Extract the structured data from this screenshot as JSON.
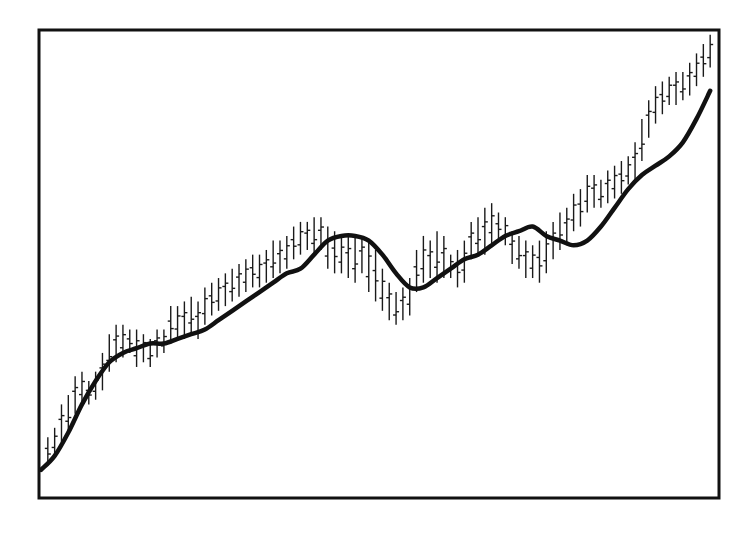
{
  "chart_data": {
    "type": "line",
    "subtype": "ohlc-bars-with-moving-average",
    "title": "",
    "xlabel": "",
    "ylabel": "",
    "grid": false,
    "legend": null,
    "axis_ticks": "none shown",
    "frame": {
      "x0": 39,
      "y0": 30,
      "x1": 719,
      "y1": 498
    },
    "ylim": [
      0,
      100
    ],
    "colors": {
      "bars": "#1a1a1a",
      "moving_average": "#111111",
      "frame": "#111111",
      "background": "#ffffff"
    },
    "series": [
      {
        "name": "Moving average",
        "style": "thick line",
        "x": [
          0,
          2,
          4,
          6,
          8,
          10,
          12,
          14,
          16,
          18,
          20,
          22,
          24,
          26,
          28,
          30,
          32,
          34,
          36,
          38,
          40,
          42,
          44,
          46,
          48,
          50,
          52,
          54,
          56,
          58,
          60,
          62,
          64,
          66,
          68,
          70,
          72,
          74,
          76,
          78,
          80,
          82,
          84,
          86,
          88,
          90,
          92,
          94,
          96,
          98
        ],
        "values": [
          6,
          9,
          14,
          20,
          25,
          29,
          31,
          32,
          33,
          33,
          34,
          35,
          36,
          38,
          40,
          42,
          44,
          46,
          48,
          49,
          52,
          55,
          56,
          56,
          55,
          52,
          48,
          45,
          45,
          47,
          49,
          51,
          52,
          54,
          56,
          57,
          58,
          56,
          55,
          54,
          55,
          58,
          62,
          66,
          69,
          71,
          73,
          76,
          81,
          87
        ]
      },
      {
        "name": "Price (OHLC bars)",
        "style": "vertical high-low bars with open/close ticks",
        "bars": [
          {
            "x": 1,
            "high": 13,
            "low": 7
          },
          {
            "x": 2,
            "high": 15,
            "low": 9
          },
          {
            "x": 3,
            "high": 20,
            "low": 12
          },
          {
            "x": 4,
            "high": 22,
            "low": 14
          },
          {
            "x": 5,
            "high": 26,
            "low": 18
          },
          {
            "x": 6,
            "high": 27,
            "low": 20
          },
          {
            "x": 7,
            "high": 25,
            "low": 20
          },
          {
            "x": 8,
            "high": 27,
            "low": 21
          },
          {
            "x": 9,
            "high": 31,
            "low": 23
          },
          {
            "x": 10,
            "high": 35,
            "low": 27
          },
          {
            "x": 11,
            "high": 37,
            "low": 29
          },
          {
            "x": 12,
            "high": 37,
            "low": 30
          },
          {
            "x": 13,
            "high": 36,
            "low": 31
          },
          {
            "x": 14,
            "high": 36,
            "low": 28
          },
          {
            "x": 15,
            "high": 35,
            "low": 29
          },
          {
            "x": 16,
            "high": 34,
            "low": 28
          },
          {
            "x": 17,
            "high": 36,
            "low": 30
          },
          {
            "x": 18,
            "high": 36,
            "low": 31
          },
          {
            "x": 19,
            "high": 41,
            "low": 33
          },
          {
            "x": 20,
            "high": 41,
            "low": 34
          },
          {
            "x": 21,
            "high": 42,
            "low": 34
          },
          {
            "x": 22,
            "high": 43,
            "low": 35
          },
          {
            "x": 23,
            "high": 42,
            "low": 34
          },
          {
            "x": 24,
            "high": 45,
            "low": 37
          },
          {
            "x": 25,
            "high": 46,
            "low": 39
          },
          {
            "x": 26,
            "high": 47,
            "low": 40
          },
          {
            "x": 27,
            "high": 48,
            "low": 41
          },
          {
            "x": 28,
            "high": 49,
            "low": 42
          },
          {
            "x": 29,
            "high": 50,
            "low": 43
          },
          {
            "x": 30,
            "high": 51,
            "low": 44
          },
          {
            "x": 31,
            "high": 52,
            "low": 45
          },
          {
            "x": 32,
            "high": 52,
            "low": 45
          },
          {
            "x": 33,
            "high": 53,
            "low": 46
          },
          {
            "x": 34,
            "high": 55,
            "low": 47
          },
          {
            "x": 35,
            "high": 55,
            "low": 48
          },
          {
            "x": 36,
            "high": 56,
            "low": 49
          },
          {
            "x": 37,
            "high": 58,
            "low": 51
          },
          {
            "x": 38,
            "high": 59,
            "low": 52
          },
          {
            "x": 39,
            "high": 59,
            "low": 53
          },
          {
            "x": 40,
            "high": 60,
            "low": 52
          },
          {
            "x": 41,
            "high": 60,
            "low": 53
          },
          {
            "x": 42,
            "high": 58,
            "low": 49
          },
          {
            "x": 43,
            "high": 57,
            "low": 48
          },
          {
            "x": 44,
            "high": 56,
            "low": 48
          },
          {
            "x": 45,
            "high": 56,
            "low": 47
          },
          {
            "x": 46,
            "high": 56,
            "low": 46
          },
          {
            "x": 47,
            "high": 56,
            "low": 48
          },
          {
            "x": 48,
            "high": 55,
            "low": 44
          },
          {
            "x": 49,
            "high": 53,
            "low": 42
          },
          {
            "x": 50,
            "high": 49,
            "low": 40
          },
          {
            "x": 51,
            "high": 46,
            "low": 38
          },
          {
            "x": 52,
            "high": 44,
            "low": 37
          },
          {
            "x": 53,
            "high": 45,
            "low": 38
          },
          {
            "x": 54,
            "high": 47,
            "low": 39
          },
          {
            "x": 55,
            "high": 53,
            "low": 44
          },
          {
            "x": 56,
            "high": 56,
            "low": 46
          },
          {
            "x": 57,
            "high": 55,
            "low": 47
          },
          {
            "x": 58,
            "high": 57,
            "low": 46
          },
          {
            "x": 59,
            "high": 56,
            "low": 47
          },
          {
            "x": 60,
            "high": 52,
            "low": 47
          },
          {
            "x": 61,
            "high": 53,
            "low": 45
          },
          {
            "x": 62,
            "high": 55,
            "low": 46
          },
          {
            "x": 63,
            "high": 59,
            "low": 51
          },
          {
            "x": 64,
            "high": 60,
            "low": 52
          },
          {
            "x": 65,
            "high": 62,
            "low": 52
          },
          {
            "x": 66,
            "high": 63,
            "low": 54
          },
          {
            "x": 67,
            "high": 61,
            "low": 55
          },
          {
            "x": 68,
            "high": 60,
            "low": 54
          },
          {
            "x": 69,
            "high": 57,
            "low": 50
          },
          {
            "x": 70,
            "high": 56,
            "low": 49
          },
          {
            "x": 71,
            "high": 55,
            "low": 47
          },
          {
            "x": 72,
            "high": 54,
            "low": 47
          },
          {
            "x": 73,
            "high": 55,
            "low": 46
          },
          {
            "x": 74,
            "high": 57,
            "low": 48
          },
          {
            "x": 75,
            "high": 59,
            "low": 51
          },
          {
            "x": 76,
            "high": 61,
            "low": 53
          },
          {
            "x": 77,
            "high": 62,
            "low": 54
          },
          {
            "x": 78,
            "high": 65,
            "low": 57
          },
          {
            "x": 79,
            "high": 66,
            "low": 58
          },
          {
            "x": 80,
            "high": 69,
            "low": 61
          },
          {
            "x": 81,
            "high": 69,
            "low": 62
          },
          {
            "x": 82,
            "high": 68,
            "low": 62
          },
          {
            "x": 83,
            "high": 70,
            "low": 63
          },
          {
            "x": 84,
            "high": 71,
            "low": 64
          },
          {
            "x": 85,
            "high": 72,
            "low": 65
          },
          {
            "x": 86,
            "high": 73,
            "low": 67
          },
          {
            "x": 87,
            "high": 76,
            "low": 68
          },
          {
            "x": 88,
            "high": 81,
            "low": 72
          },
          {
            "x": 89,
            "high": 85,
            "low": 77
          },
          {
            "x": 90,
            "high": 88,
            "low": 80
          },
          {
            "x": 91,
            "high": 89,
            "low": 82
          },
          {
            "x": 92,
            "high": 90,
            "low": 84
          },
          {
            "x": 93,
            "high": 91,
            "low": 84
          },
          {
            "x": 94,
            "high": 91,
            "low": 85
          },
          {
            "x": 95,
            "high": 93,
            "low": 86
          },
          {
            "x": 96,
            "high": 95,
            "low": 88
          },
          {
            "x": 97,
            "high": 97,
            "low": 90
          },
          {
            "x": 98,
            "high": 99,
            "low": 92
          }
        ]
      }
    ]
  }
}
